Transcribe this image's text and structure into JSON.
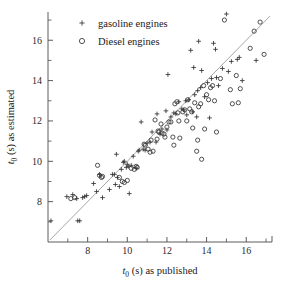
{
  "chart_data": {
    "type": "scatter",
    "title": "",
    "xlabel": "t0 (s)  as published",
    "ylabel": "t0 (s)  as estimated",
    "xlabel_parts": {
      "var": "t",
      "sub": "0",
      "rest": "(s)  as published"
    },
    "ylabel_parts": {
      "var": "t",
      "sub": "0",
      "rest": "(s)  as estimated"
    },
    "xlim": [
      6.0,
      17.3
    ],
    "ylim": [
      6.0,
      17.4
    ],
    "x_ticks_major": [
      8,
      10,
      12,
      14,
      16
    ],
    "y_ticks_major": [
      8,
      10,
      12,
      14,
      16
    ],
    "x_ticks_minor": [
      7,
      9,
      11,
      13,
      15,
      17
    ],
    "y_ticks_minor": [
      7,
      9,
      11,
      13,
      15,
      17
    ],
    "x_tick_labels": [
      "8",
      "10",
      "12",
      "14",
      "16"
    ],
    "y_tick_labels": [
      "8",
      "10",
      "12",
      "14",
      "16"
    ],
    "grid": false,
    "legend_position": "top-left",
    "reference_line": {
      "name": "identity",
      "label": "y = x",
      "from": [
        6.1,
        6.1
      ],
      "to": [
        17.2,
        17.2
      ]
    },
    "series": [
      {
        "name": "gasoline engines",
        "marker": "plus",
        "color": "#333333",
        "points": [
          [
            6.15,
            7.05
          ],
          [
            6.95,
            8.25
          ],
          [
            7.25,
            8.35
          ],
          [
            7.45,
            8.15
          ],
          [
            7.5,
            7.05
          ],
          [
            7.6,
            7.05
          ],
          [
            7.75,
            8.2
          ],
          [
            7.85,
            8.25
          ],
          [
            7.95,
            8.3
          ],
          [
            8.3,
            8.9
          ],
          [
            8.45,
            8.5
          ],
          [
            8.6,
            9.35
          ],
          [
            8.75,
            8.2
          ],
          [
            9.1,
            8.6
          ],
          [
            9.25,
            9.35
          ],
          [
            9.35,
            9.35
          ],
          [
            9.4,
            8.85
          ],
          [
            9.45,
            10.35
          ],
          [
            9.5,
            9.2
          ],
          [
            9.6,
            8.75
          ],
          [
            9.7,
            9.6
          ],
          [
            9.8,
            9.95
          ],
          [
            9.85,
            10.0
          ],
          [
            9.95,
            9.7
          ],
          [
            10.0,
            9.85
          ],
          [
            10.05,
            9.75
          ],
          [
            10.1,
            8.4
          ],
          [
            10.2,
            9.8
          ],
          [
            10.3,
            10.25
          ],
          [
            10.45,
            9.65
          ],
          [
            10.55,
            10.5
          ],
          [
            10.6,
            10.55
          ],
          [
            10.7,
            11.95
          ],
          [
            10.8,
            10.6
          ],
          [
            10.9,
            10.55
          ],
          [
            11.0,
            10.9
          ],
          [
            11.15,
            10.95
          ],
          [
            11.25,
            11.45
          ],
          [
            11.45,
            10.95
          ],
          [
            11.5,
            12.35
          ],
          [
            11.65,
            11.35
          ],
          [
            11.75,
            11.6
          ],
          [
            11.95,
            12.5
          ],
          [
            12.0,
            11.55
          ],
          [
            12.05,
            14.3
          ],
          [
            12.2,
            12.2
          ],
          [
            12.35,
            12.4
          ],
          [
            12.45,
            12.35
          ],
          [
            12.6,
            12.95
          ],
          [
            12.75,
            12.6
          ],
          [
            12.85,
            12.55
          ],
          [
            12.95,
            13.0
          ],
          [
            13.0,
            12.3
          ],
          [
            13.1,
            13.05
          ],
          [
            13.2,
            15.5
          ],
          [
            13.3,
            12.45
          ],
          [
            13.35,
            14.65
          ],
          [
            13.4,
            13.3
          ],
          [
            13.5,
            12.2
          ],
          [
            13.55,
            13.5
          ],
          [
            13.6,
            15.95
          ],
          [
            13.7,
            13.65
          ],
          [
            13.75,
            14.5
          ],
          [
            13.9,
            13.2
          ],
          [
            14.05,
            13.9
          ],
          [
            14.15,
            12.15
          ],
          [
            14.25,
            14.1
          ],
          [
            14.35,
            15.85
          ],
          [
            14.45,
            15.55
          ],
          [
            14.5,
            14.15
          ],
          [
            14.6,
            13.75
          ],
          [
            14.8,
            14.6
          ],
          [
            15.0,
            17.3
          ],
          [
            15.1,
            14.45
          ],
          [
            15.25,
            14.95
          ],
          [
            15.55,
            15.05
          ],
          [
            15.65,
            15.15
          ],
          [
            15.8,
            14.0
          ],
          [
            16.5,
            15.0
          ]
        ]
      },
      {
        "name": "Diesel engines",
        "marker": "circle",
        "color": "#333333",
        "points": [
          [
            7.15,
            8.15
          ],
          [
            7.35,
            8.2
          ],
          [
            8.5,
            9.8
          ],
          [
            8.6,
            9.3
          ],
          [
            8.7,
            9.2
          ],
          [
            8.75,
            9.25
          ],
          [
            9.6,
            9.2
          ],
          [
            9.75,
            9.0
          ],
          [
            9.85,
            8.95
          ],
          [
            10.0,
            9.05
          ],
          [
            10.2,
            9.65
          ],
          [
            10.35,
            9.6
          ],
          [
            10.45,
            9.75
          ],
          [
            10.5,
            9.7
          ],
          [
            10.85,
            10.85
          ],
          [
            10.9,
            10.8
          ],
          [
            11.05,
            10.6
          ],
          [
            11.15,
            10.45
          ],
          [
            11.2,
            11.05
          ],
          [
            11.3,
            10.5
          ],
          [
            11.4,
            12.05
          ],
          [
            11.5,
            11.1
          ],
          [
            11.55,
            11.5
          ],
          [
            11.6,
            11.45
          ],
          [
            11.7,
            11.85
          ],
          [
            11.75,
            11.4
          ],
          [
            11.85,
            11.35
          ],
          [
            11.9,
            11.2
          ],
          [
            12.0,
            11.7
          ],
          [
            12.1,
            11.95
          ],
          [
            12.2,
            11.95
          ],
          [
            12.3,
            11.2
          ],
          [
            12.35,
            10.8
          ],
          [
            12.4,
            12.85
          ],
          [
            12.5,
            12.95
          ],
          [
            12.55,
            12.4
          ],
          [
            12.6,
            12.0
          ],
          [
            12.65,
            11.15
          ],
          [
            12.8,
            12.45
          ],
          [
            12.9,
            12.55
          ],
          [
            13.0,
            12.0
          ],
          [
            13.05,
            13.05
          ],
          [
            13.15,
            12.6
          ],
          [
            13.25,
            12.45
          ],
          [
            13.3,
            11.65
          ],
          [
            13.4,
            12.9
          ],
          [
            13.5,
            10.5
          ],
          [
            13.55,
            11.05
          ],
          [
            13.6,
            12.7
          ],
          [
            13.7,
            12.85
          ],
          [
            13.75,
            10.1
          ],
          [
            13.85,
            13.75
          ],
          [
            13.9,
            11.6
          ],
          [
            14.0,
            13.3
          ],
          [
            14.1,
            13.05
          ],
          [
            14.2,
            13.65
          ],
          [
            14.3,
            13.75
          ],
          [
            14.4,
            13.0
          ],
          [
            14.5,
            11.45
          ],
          [
            14.7,
            14.1
          ],
          [
            14.9,
            17.0
          ],
          [
            15.2,
            13.55
          ],
          [
            15.3,
            12.85
          ],
          [
            15.5,
            14.25
          ],
          [
            15.6,
            12.9
          ],
          [
            15.7,
            13.6
          ],
          [
            16.2,
            15.6
          ],
          [
            16.4,
            16.45
          ],
          [
            16.7,
            16.9
          ],
          [
            16.9,
            15.3
          ]
        ]
      }
    ]
  },
  "legend": {
    "entries": [
      {
        "label": "gasoline engines",
        "marker": "plus"
      },
      {
        "label": "Diesel engines",
        "marker": "circle"
      }
    ]
  }
}
